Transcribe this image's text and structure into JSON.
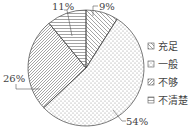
{
  "chart_data": {
    "type": "pie",
    "title": "",
    "categories": [
      "充足",
      "一般",
      "不够",
      "不清楚"
    ],
    "values": [
      9,
      54,
      26,
      11
    ],
    "unit": "%",
    "labels": [
      "9%",
      "54%",
      "26%",
      "11%"
    ],
    "patterns": [
      "diagonal-backslash-hatch",
      "dots",
      "diagonal-slash-hatch",
      "horizontal-lines"
    ],
    "start_angle": "12 o'clock",
    "direction": "clockwise",
    "legend_position": "right"
  },
  "legend": [
    {
      "label": "充足"
    },
    {
      "label": "一般"
    },
    {
      "label": "不够"
    },
    {
      "label": "不清楚"
    }
  ],
  "slice_labels": {
    "s0": "9%",
    "s1": "54%",
    "s2": "26%",
    "s3": "11%"
  }
}
